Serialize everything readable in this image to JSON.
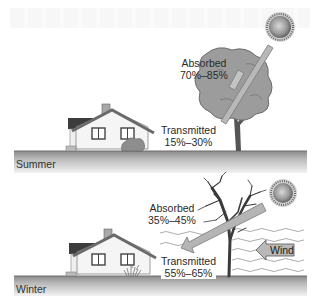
{
  "panels": {
    "summer": {
      "season_label": "Summer",
      "absorbed_label": "Absorbed",
      "absorbed_range": "70%–85%",
      "transmitted_label": "Transmitted",
      "transmitted_range": "15%–30%"
    },
    "winter": {
      "season_label": "Winter",
      "absorbed_label": "Absorbed",
      "absorbed_range": "35%–45%",
      "transmitted_label": "Transmitted",
      "transmitted_range": "55%–65%",
      "wind_label": "Wind"
    }
  },
  "icons": [
    "sun-icon",
    "leafy-tree-icon",
    "bare-tree-icon",
    "house-icon",
    "shrub-icon",
    "sunlight-arrow-icon",
    "wind-arrow-icon",
    "wind-waves-icon"
  ],
  "colors": {
    "ground_top": "#8a8a8a",
    "ground_bottom": "#f2f2f2",
    "canopy": "#9a9a9a",
    "arrow": "#b3b3b3",
    "sun_core": "#c9c9c9",
    "sun_edge": "#6a6a6a",
    "house_wall": "#f4f4f4",
    "roof": "#6e6e6e"
  }
}
